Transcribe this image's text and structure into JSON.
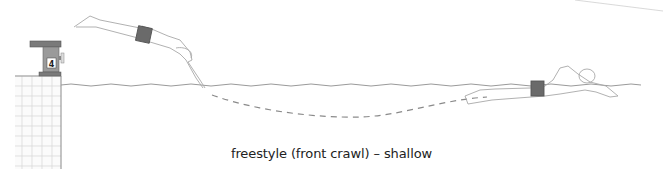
{
  "diagram": {
    "caption": "freestyle (front crawl) – shallow",
    "starting_block": {
      "lane_number": "4"
    },
    "elements": [
      "starting-block",
      "pool-wall-tiles",
      "water-surface",
      "diving-swimmer",
      "underwater-glide-path",
      "swimming-swimmer"
    ],
    "colors": {
      "line": "#9a9a9a",
      "block": "#777777",
      "swimsuit": "#6a6a6a",
      "tile": "#cfcfcf",
      "path": "#8a8a8a"
    }
  }
}
